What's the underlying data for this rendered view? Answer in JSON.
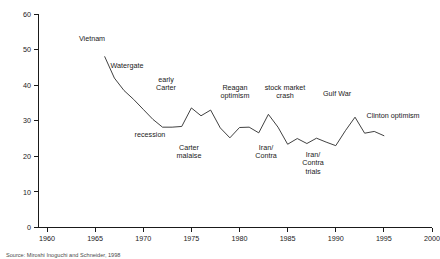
{
  "chart_data": {
    "type": "line",
    "title": "",
    "subtitle": "",
    "xlabel": "",
    "ylabel": "",
    "xlim": [
      1960,
      2000
    ],
    "ylim": [
      0,
      60
    ],
    "grid": false,
    "legend_position": "none",
    "x_ticks": [
      1960,
      1965,
      1970,
      1975,
      1980,
      1985,
      1990,
      1995,
      2000
    ],
    "y_ticks": [
      0,
      10,
      20,
      30,
      40,
      50,
      60
    ],
    "x_tick_labels": [
      "1960",
      "1965",
      "1970",
      "1975",
      "1980",
      "1985",
      "1990",
      "1995",
      "2000"
    ],
    "y_tick_labels": [
      "0",
      "10",
      "20",
      "30",
      "40",
      "50",
      "60"
    ],
    "series": [
      {
        "name": "Trust in government",
        "color": "#2b2b2b",
        "x": [
          1966,
          1967,
          1968,
          1969,
          1970,
          1971,
          1972,
          1973,
          1974,
          1975,
          1976,
          1977,
          1978,
          1979,
          1980,
          1981,
          1982,
          1983,
          1984,
          1985,
          1986,
          1987,
          1988,
          1989,
          1990,
          1991,
          1992,
          1993,
          1994,
          1995
        ],
        "y": [
          48.0,
          42.0,
          38.5,
          36.0,
          33.2,
          30.4,
          28.2,
          28.2,
          28.4,
          33.6,
          31.4,
          33.0,
          28.0,
          25.2,
          28.1,
          28.2,
          26.6,
          31.8,
          28.2,
          23.4,
          25.0,
          23.6,
          25.1,
          24.0,
          23.0,
          27.2,
          31.0,
          26.5,
          27.0,
          25.8
        ]
      }
    ],
    "annotations": [
      {
        "label": "Vietnam",
        "x_px": 92,
        "y_px": 41,
        "lines": [
          "Vietnam"
        ]
      },
      {
        "label": "Watergate",
        "x_px": 127,
        "y_px": 68,
        "lines": [
          "Watergate"
        ]
      },
      {
        "label": "early Carter",
        "x_px": 166,
        "y_px": 82,
        "lines": [
          "early",
          "Carter"
        ]
      },
      {
        "label": "recession",
        "x_px": 150,
        "y_px": 137,
        "lines": [
          "recession"
        ]
      },
      {
        "label": "Carter malaise",
        "x_px": 189,
        "y_px": 150,
        "lines": [
          "Carter",
          "malaise"
        ]
      },
      {
        "label": "Reagan optimism",
        "x_px": 235,
        "y_px": 90,
        "lines": [
          "Reagan",
          "optimism"
        ]
      },
      {
        "label": "stock market crash",
        "x_px": 285,
        "y_px": 90,
        "lines": [
          "stock market",
          "crash"
        ]
      },
      {
        "label": "Iran/Contra",
        "x_px": 266,
        "y_px": 150,
        "lines": [
          "Iran/",
          "Contra"
        ]
      },
      {
        "label": "Iran/Contra trials",
        "x_px": 313,
        "y_px": 157,
        "lines": [
          "Iran/",
          "Contra",
          "trials"
        ]
      },
      {
        "label": "Gulf War",
        "x_px": 337,
        "y_px": 96,
        "lines": [
          "Gulf War"
        ]
      },
      {
        "label": "Clinton optimism",
        "x_px": 393,
        "y_px": 118,
        "lines": [
          "Clinton optimism"
        ]
      }
    ]
  },
  "source": {
    "text": "Source: Miroshi Inoguchi and Schneider, 1998"
  }
}
